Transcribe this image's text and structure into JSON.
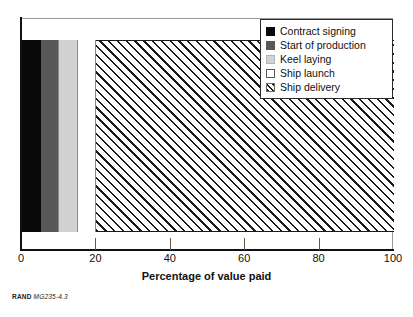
{
  "figure": {
    "source_caption_org": "RAND",
    "source_caption_id": "MG235-4.3"
  },
  "legend": {
    "position": "top-right",
    "items": [
      {
        "label": "Contract signing",
        "swatch": "solid-black",
        "color": "#0a0a0a"
      },
      {
        "label": "Start of production",
        "swatch": "solid-dark-gray",
        "color": "#585858"
      },
      {
        "label": "Keel laying",
        "swatch": "solid-light-gray",
        "color": "#d2d2d2"
      },
      {
        "label": "Ship launch",
        "swatch": "solid-white",
        "color": "#ffffff"
      },
      {
        "label": "Ship delivery",
        "swatch": "diagonal-hatch",
        "color": "#1a1a1a"
      }
    ]
  },
  "axis": {
    "x_title": "Percentage of value paid",
    "ticks": [
      {
        "value": 0,
        "label": "0"
      },
      {
        "value": 20,
        "label": "20"
      },
      {
        "value": 40,
        "label": "40"
      },
      {
        "value": 60,
        "label": "60"
      },
      {
        "value": 80,
        "label": "80"
      },
      {
        "value": 100,
        "label": "100"
      }
    ]
  },
  "chart_data": {
    "type": "bar",
    "orientation": "horizontal",
    "stacked": true,
    "title": "",
    "subtitle": "",
    "xlabel": "Percentage of value paid",
    "ylabel": "",
    "xlim": [
      0,
      100
    ],
    "grid": false,
    "legend_position": "top-right",
    "categories": [
      "Payment milestones"
    ],
    "series": [
      {
        "name": "Contract signing",
        "values": [
          5
        ],
        "fill": "#0a0a0a",
        "pattern": "solid"
      },
      {
        "name": "Start of production",
        "values": [
          5
        ],
        "fill": "#585858",
        "pattern": "solid"
      },
      {
        "name": "Keel laying",
        "values": [
          5
        ],
        "fill": "#d2d2d2",
        "pattern": "solid"
      },
      {
        "name": "Ship launch",
        "values": [
          5
        ],
        "fill": "#ffffff",
        "pattern": "solid"
      },
      {
        "name": "Ship delivery",
        "values": [
          80
        ],
        "fill": "#ffffff",
        "pattern": "diagonal-hatch"
      }
    ],
    "xtick_labels": [
      "0",
      "20",
      "40",
      "60",
      "80",
      "100"
    ],
    "xtick_values": [
      0,
      20,
      40,
      60,
      80,
      100
    ],
    "annotations": [
      "RAND MG235-4.3"
    ]
  }
}
